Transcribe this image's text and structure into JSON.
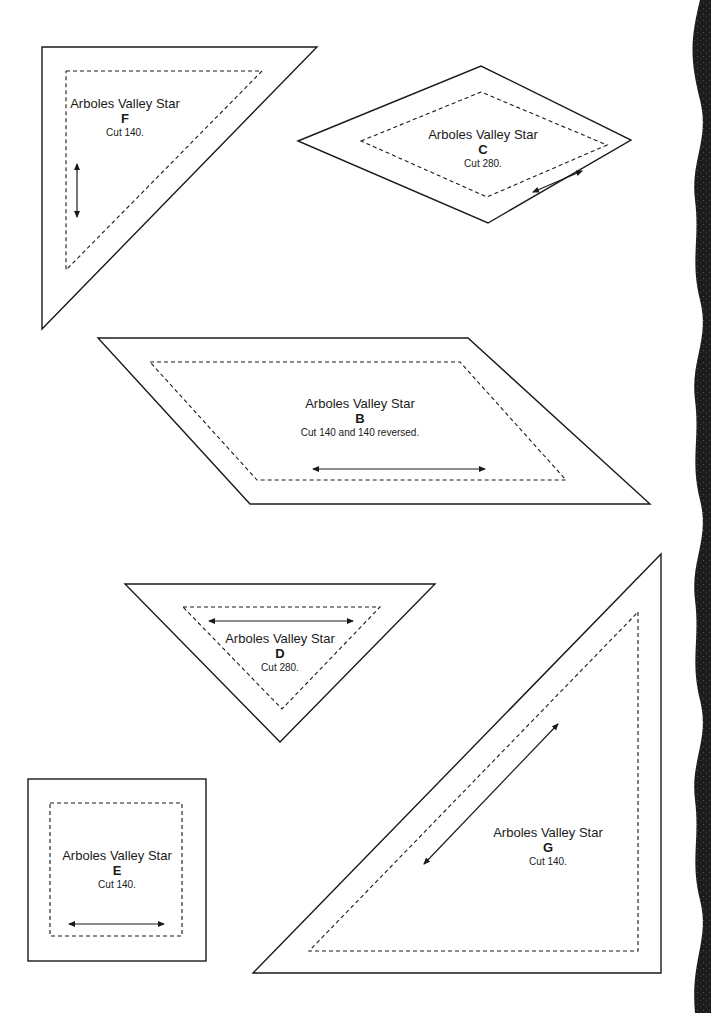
{
  "page": {
    "background": "#ffffff",
    "line_color": "#1a1a1a",
    "edge_decoration": "wavy-dark-border-right"
  },
  "pieces": [
    {
      "id": "F",
      "title": "Arboles Valley Star",
      "letter": "F",
      "cut": "Cut 140.",
      "shape": "right-triangle",
      "grain": "vertical"
    },
    {
      "id": "C",
      "title": "Arboles Valley Star",
      "letter": "C",
      "cut": "Cut 280.",
      "shape": "diamond",
      "grain": "diagonal"
    },
    {
      "id": "B",
      "title": "Arboles Valley Star",
      "letter": "B",
      "cut": "Cut 140 and 140 reversed.",
      "shape": "parallelogram",
      "grain": "horizontal"
    },
    {
      "id": "D",
      "title": "Arboles Valley Star",
      "letter": "D",
      "cut": "Cut 280.",
      "shape": "triangle",
      "grain": "horizontal"
    },
    {
      "id": "E",
      "title": "Arboles Valley Star",
      "letter": "E",
      "cut": "Cut 140.",
      "shape": "square",
      "grain": "horizontal"
    },
    {
      "id": "G",
      "title": "Arboles Valley Star",
      "letter": "G",
      "cut": "Cut 140.",
      "shape": "right-triangle",
      "grain": "diagonal"
    }
  ]
}
